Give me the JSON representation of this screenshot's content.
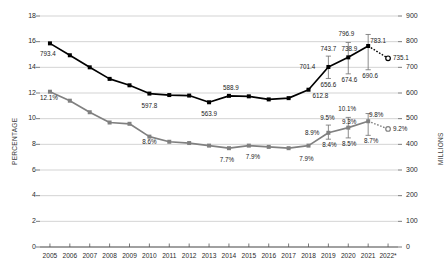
{
  "chart_data": {
    "type": "line",
    "title": "",
    "subtitle": "",
    "xlabel": "",
    "ylabel": "PERCENTAGE",
    "y2label": "MILLIONS",
    "grid": true,
    "legend_position": "none",
    "x": [
      "2005",
      "2006",
      "2007",
      "2008",
      "2009",
      "2010",
      "2011",
      "2012",
      "2013",
      "2014",
      "2015",
      "2016",
      "2017",
      "2018",
      "2019",
      "2020",
      "2021",
      "2022*"
    ],
    "categories": [
      "2005",
      "2006",
      "2007",
      "2008",
      "2009",
      "2010",
      "2011",
      "2012",
      "2013",
      "2014",
      "2015",
      "2016",
      "2017",
      "2018",
      "2019",
      "2020",
      "2021",
      "2022*"
    ],
    "ylim": [
      0,
      18
    ],
    "y2lim": [
      0,
      900
    ],
    "y_ticks": [
      0,
      2,
      4,
      6,
      8,
      10,
      12,
      14,
      16,
      18
    ],
    "y2_ticks": [
      0,
      100,
      200,
      300,
      400,
      500,
      600,
      700,
      800,
      900
    ],
    "series": [
      {
        "name": "Number undernourished (millions)",
        "axis": "right",
        "color": "#000000",
        "marker": "filled-square",
        "values": [
          793.4,
          747.0,
          700.0,
          655.0,
          630.0,
          597.8,
          592.0,
          590.0,
          563.9,
          588.9,
          587.0,
          575.0,
          580.0,
          612.8,
          701.4,
          738.9,
          783.1,
          735.1
        ],
        "projected_index": 17,
        "projected_marker": "open-circle",
        "projected_linestyle": "dotted",
        "point_labels": [
          {
            "x": "2005",
            "value": 793.4,
            "text": "793.4"
          },
          {
            "x": "2010",
            "value": 597.8,
            "text": "597.8"
          },
          {
            "x": "2013",
            "value": 563.9,
            "text": "563.9"
          },
          {
            "x": "2014",
            "value": 588.9,
            "text": "588.9"
          },
          {
            "x": "2018",
            "value": 612.8,
            "text": "612.8"
          },
          {
            "x": "2019",
            "value": 701.4,
            "text": "701.4"
          },
          {
            "x": "2020",
            "value": 738.9,
            "text": "738.9"
          },
          {
            "x": "2021",
            "value": 783.1,
            "text": "783.1"
          },
          {
            "x": "2022*",
            "value": 735.1,
            "text": "735.1"
          }
        ],
        "error_bars": [
          {
            "x": "2019",
            "value": 701.4,
            "low": 656.6,
            "high": 743.7,
            "low_label": "656.6",
            "high_label": "743.7"
          },
          {
            "x": "2020",
            "value": 738.9,
            "low": 674.6,
            "high": 796.9,
            "low_label": "674.6",
            "high_label": "796.9"
          },
          {
            "x": "2021",
            "value": 783.1,
            "low": 690.6,
            "high": 828.0,
            "low_label": "690.6",
            "high_label": ""
          }
        ]
      },
      {
        "name": "Prevalence of undernourishment (percentage)",
        "axis": "left",
        "color": "#808080",
        "marker": "filled-square",
        "values": [
          12.1,
          11.4,
          10.5,
          9.7,
          9.6,
          8.6,
          8.2,
          8.1,
          7.9,
          7.7,
          7.9,
          7.8,
          7.7,
          7.9,
          8.9,
          9.3,
          9.8,
          9.2
        ],
        "projected_index": 17,
        "projected_marker": "open-circle",
        "projected_linestyle": "dotted",
        "point_labels": [
          {
            "x": "2005",
            "value": 12.1,
            "text": "12.1%"
          },
          {
            "x": "2010",
            "value": 8.6,
            "text": "8.6%"
          },
          {
            "x": "2014",
            "value": 7.7,
            "text": "7.7%"
          },
          {
            "x": "2015",
            "value": 7.9,
            "text": "7.9%"
          },
          {
            "x": "2018",
            "value": 7.9,
            "text": "7.9%"
          },
          {
            "x": "2019",
            "value": 8.9,
            "text": "8.9%"
          },
          {
            "x": "2020",
            "value": 9.3,
            "text": "9.3%"
          },
          {
            "x": "2021",
            "value": 9.8,
            "text": "9.8%"
          },
          {
            "x": "2022*",
            "value": 9.2,
            "text": "9.2%"
          }
        ],
        "error_bars": [
          {
            "x": "2019",
            "value": 8.9,
            "low": 8.4,
            "high": 9.5,
            "low_label": "8.4%",
            "high_label": "9.5%"
          },
          {
            "x": "2020",
            "value": 9.3,
            "low": 8.5,
            "high": 10.1,
            "low_label": "8.5%",
            "high_label": "10.1%"
          },
          {
            "x": "2021",
            "value": 9.8,
            "low": 8.7,
            "high": 10.4,
            "low_label": "8.7%",
            "high_label": ""
          }
        ]
      }
    ]
  },
  "axes": {
    "left_title": "PERCENTAGE",
    "right_title": "MILLIONS",
    "left_ticks": [
      "0",
      "2",
      "4",
      "6",
      "8",
      "10",
      "12",
      "14",
      "16",
      "18"
    ],
    "right_ticks": [
      "0",
      "100",
      "200",
      "300",
      "400",
      "500",
      "600",
      "700",
      "800",
      "900"
    ],
    "x_ticks": [
      "2005",
      "2006",
      "2007",
      "2008",
      "2009",
      "2010",
      "2011",
      "2012",
      "2013",
      "2014",
      "2015",
      "2016",
      "2017",
      "2018",
      "2019",
      "2020",
      "2021",
      "2022*"
    ]
  },
  "colors": {
    "millions_series": "#000000",
    "percentage_series": "#808080",
    "gridline": "#c8c8c8",
    "axis": "#595959",
    "text": "#1a1a1a"
  }
}
